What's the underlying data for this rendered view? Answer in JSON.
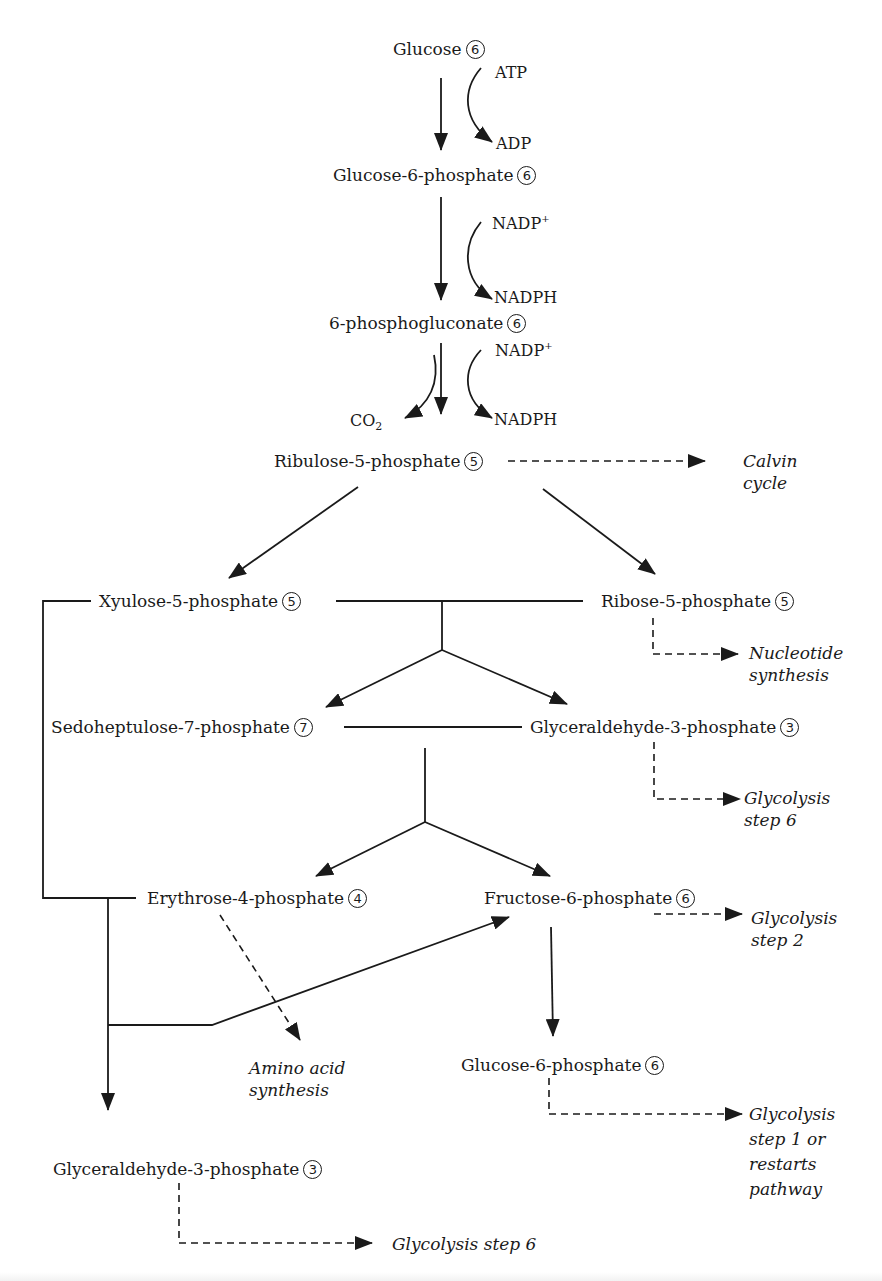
{
  "diagram": {
    "colors": {
      "ink": "#1a1a1a",
      "background": "#ffffff"
    },
    "nodes": {
      "glucose": {
        "label": "Glucose",
        "carbons": "6"
      },
      "g6p_top": {
        "label": "Glucose-6-phosphate",
        "carbons": "6"
      },
      "phosphogluconate": {
        "label": "6-phosphogluconate",
        "carbons": "6"
      },
      "ribulose5p": {
        "label": "Ribulose-5-phosphate",
        "carbons": "5"
      },
      "xylulose5p": {
        "label": "Xyulose-5-phosphate",
        "carbons": "5"
      },
      "ribose5p": {
        "label": "Ribose-5-phosphate",
        "carbons": "5"
      },
      "sedoheptulose7p": {
        "label": "Sedoheptulose-7-phosphate",
        "carbons": "7"
      },
      "g3p_mid": {
        "label": "Glyceraldehyde-3-phosphate",
        "carbons": "3"
      },
      "erythrose4p": {
        "label": "Erythrose-4-phosphate",
        "carbons": "4"
      },
      "fructose6p": {
        "label": "Fructose-6-phosphate",
        "carbons": "6"
      },
      "g6p_bottom": {
        "label": "Glucose-6-phosphate",
        "carbons": "6"
      },
      "g3p_bottom": {
        "label": "Glyceraldehyde-3-phosphate",
        "carbons": "3"
      }
    },
    "cofactors": {
      "atp": "ATP",
      "adp": "ADP",
      "nadp1": {
        "base": "NADP",
        "sup": "+"
      },
      "nadph1": "NADPH",
      "nadp2": {
        "base": "NADP",
        "sup": "+"
      },
      "nadph2": "NADPH",
      "co2": {
        "base": "CO",
        "sub": "2"
      }
    },
    "destinations": {
      "calvin": [
        "Calvin",
        "cycle"
      ],
      "nucleotide": [
        "Nucleotide",
        "synthesis"
      ],
      "glycolysis6_mid": [
        "Glycolysis",
        "step 6"
      ],
      "glycolysis2": [
        "Glycolysis",
        "step 2"
      ],
      "amino": [
        "Amino acid",
        "synthesis"
      ],
      "glycolysis1": [
        "Glycolysis",
        "step 1 or",
        "restarts",
        "pathway"
      ],
      "glycolysis6_bottom": "Glycolysis step 6"
    }
  }
}
